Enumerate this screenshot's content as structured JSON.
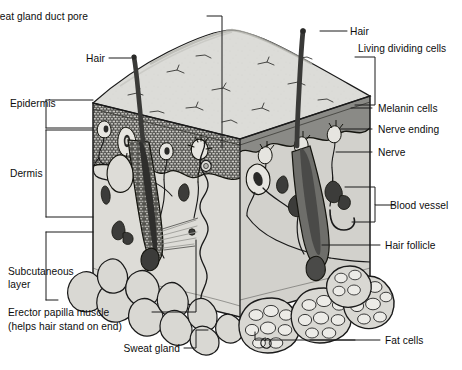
{
  "figure": {
    "type": "anatomical-diagram",
    "view": "3D cutaway block"
  },
  "colors": {
    "ink": "#111111",
    "outline": "#1a1a1a",
    "top_surface": "#dcdcd8",
    "top_surface_shadow": "#c9c9c4",
    "epidermis_front": "#575754",
    "epidermis_stipple": "#2e2e2c",
    "melanin_band_right": "#8a8a86",
    "dermis_fill": "#dddcd7",
    "dermis_right": "#d2d1cc",
    "follicle_dark": "#4a4a48",
    "follicle_right": "#6e6e6a",
    "vessel_dark": "#3c3c3a",
    "fat_fill": "#d9d8d3",
    "fat_cell": "#e8e7e3",
    "hair_shaft": "#3a3a38",
    "leader_line": "#1a1a1a",
    "background": "#ffffff"
  },
  "labels": {
    "sweat_gland_duct_pore": "Sweat gland duct pore",
    "hair_left": "Hair",
    "hair_right": "Hair",
    "living_dividing_cells": "Living dividing cells",
    "melanin_cells": "Melanin cells",
    "nerve_ending": "Nerve ending",
    "nerve": "Nerve",
    "blood_vessel": "Blood vessel",
    "hair_follicle": "Hair follicle",
    "fat_cells": "Fat cells",
    "epidermis": "Epidermis",
    "dermis": "Dermis",
    "subcutaneous_layer_line1": "Subcutaneous",
    "subcutaneous_layer_line2": "layer",
    "erector_papilla_muscle_line1": "Erector papilla muscle",
    "erector_papilla_muscle_line2": "(helps hair stand on end)",
    "sweat_gland": "Sweat gland"
  },
  "layers": [
    {
      "name": "Epidermis",
      "bracket": "left"
    },
    {
      "name": "Dermis",
      "bracket": "left"
    },
    {
      "name": "Subcutaneous layer",
      "bracket": "left"
    }
  ],
  "structures": [
    "Sweat gland duct pore",
    "Hair",
    "Living dividing cells",
    "Melanin cells",
    "Nerve ending",
    "Nerve",
    "Blood vessel",
    "Hair follicle",
    "Fat cells",
    "Erector papilla muscle",
    "Sweat gland"
  ]
}
